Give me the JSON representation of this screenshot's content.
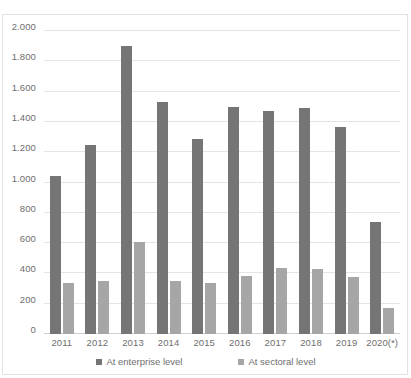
{
  "chart_data": {
    "type": "bar",
    "title": "",
    "xlabel": "",
    "ylabel": "",
    "ylim": [
      0,
      2000
    ],
    "ytick_step": 200,
    "grid": true,
    "legend_position": "bottom",
    "y_tick_labels": [
      "0",
      "200",
      "400",
      "600",
      "800",
      "1.000",
      "1.200",
      "1.400",
      "1.600",
      "1.800",
      "2.000"
    ],
    "y_tick_values": [
      0,
      200,
      400,
      600,
      800,
      1000,
      1200,
      1400,
      1600,
      1800,
      2000
    ],
    "categories": [
      "2011",
      "2012",
      "2013",
      "2014",
      "2015",
      "2016",
      "2017",
      "2018",
      "2019",
      "2020(*)"
    ],
    "series": [
      {
        "name": "At enterprise level",
        "color": "#757575",
        "values": [
          1040,
          1250,
          1900,
          1530,
          1285,
          1500,
          1470,
          1490,
          1365,
          740
        ]
      },
      {
        "name": "At sectoral level",
        "color": "#a6a6a6",
        "values": [
          340,
          350,
          610,
          350,
          340,
          385,
          435,
          430,
          375,
          175
        ]
      }
    ]
  },
  "legend": {
    "items": [
      {
        "label": "At enterprise level",
        "color": "#757575"
      },
      {
        "label": "At sectoral level",
        "color": "#a6a6a6"
      }
    ]
  },
  "appearance": {
    "title_sliver": "",
    "grid_color": "#e4e4e4",
    "axis_color": "#d0d0d0",
    "border_color": "#e2e2e2",
    "text_color": "#6e6e6e",
    "background": "#ffffff"
  }
}
